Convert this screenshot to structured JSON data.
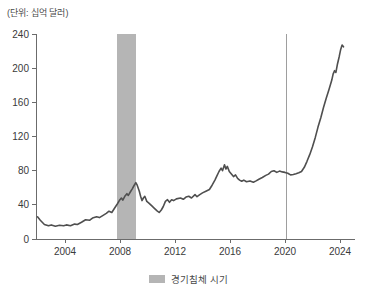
{
  "unit_label": "(단위: 십억 달러)",
  "legend": {
    "recession_label": "경기침체 시기",
    "swatch_style": "background:#b5b5b5"
  },
  "colors": {
    "line": "#4f4f4f",
    "band": "#b5b5b5",
    "vline": "#9e9e9e",
    "axis": "#6b6b6b",
    "tick_text": "#3a3a3a"
  },
  "chart_data": {
    "type": "line",
    "title": "",
    "unit": "(단위: 십억 달러)",
    "xlabel": "",
    "ylabel": "",
    "x_ticks": [
      2004,
      2008,
      2012,
      2016,
      2020,
      2024
    ],
    "y_ticks": [
      0,
      40,
      80,
      120,
      160,
      200,
      240
    ],
    "xlim": [
      2001.89,
      2025.09
    ],
    "ylim": [
      0,
      240
    ],
    "grid": false,
    "legend_position": "bottom",
    "recession_bands": [
      {
        "start": 2007.8,
        "end": 2009.15
      }
    ],
    "vlines": [
      2020.1
    ],
    "series": [
      {
        "name": "경기침체 시기 차트 값",
        "points": [
          [
            2002.0,
            26
          ],
          [
            2002.2,
            22
          ],
          [
            2002.5,
            17
          ],
          [
            2002.8,
            15.5
          ],
          [
            2003.0,
            16.5
          ],
          [
            2003.3,
            15
          ],
          [
            2003.6,
            16
          ],
          [
            2003.9,
            15.5
          ],
          [
            2004.1,
            16.5
          ],
          [
            2004.4,
            15.5
          ],
          [
            2004.7,
            17.5
          ],
          [
            2004.9,
            17
          ],
          [
            2005.2,
            19.5
          ],
          [
            2005.5,
            22.5
          ],
          [
            2005.8,
            22
          ],
          [
            2006.0,
            24.5
          ],
          [
            2006.3,
            26
          ],
          [
            2006.5,
            25
          ],
          [
            2006.8,
            28
          ],
          [
            2007.0,
            30
          ],
          [
            2007.2,
            32.5
          ],
          [
            2007.4,
            31
          ],
          [
            2007.6,
            36
          ],
          [
            2007.8,
            41
          ],
          [
            2007.95,
            45
          ],
          [
            2008.1,
            48
          ],
          [
            2008.2,
            45.5
          ],
          [
            2008.35,
            50
          ],
          [
            2008.5,
            53
          ],
          [
            2008.6,
            51
          ],
          [
            2008.75,
            55
          ],
          [
            2008.9,
            59
          ],
          [
            2009.0,
            62
          ],
          [
            2009.15,
            66
          ],
          [
            2009.25,
            63
          ],
          [
            2009.4,
            56
          ],
          [
            2009.5,
            50
          ],
          [
            2009.6,
            45
          ],
          [
            2009.7,
            48
          ],
          [
            2009.8,
            50
          ],
          [
            2009.95,
            44
          ],
          [
            2010.1,
            42
          ],
          [
            2010.3,
            39
          ],
          [
            2010.5,
            36
          ],
          [
            2010.7,
            33
          ],
          [
            2010.85,
            31
          ],
          [
            2011.0,
            34
          ],
          [
            2011.15,
            38
          ],
          [
            2011.3,
            44
          ],
          [
            2011.45,
            46
          ],
          [
            2011.6,
            43
          ],
          [
            2011.75,
            46
          ],
          [
            2011.9,
            45
          ],
          [
            2012.1,
            47
          ],
          [
            2012.4,
            48
          ],
          [
            2012.6,
            46.5
          ],
          [
            2012.8,
            49
          ],
          [
            2013.0,
            50
          ],
          [
            2013.2,
            48
          ],
          [
            2013.45,
            52
          ],
          [
            2013.6,
            49.5
          ],
          [
            2013.8,
            52
          ],
          [
            2014.0,
            54
          ],
          [
            2014.25,
            56
          ],
          [
            2014.5,
            58
          ],
          [
            2014.7,
            63
          ],
          [
            2014.9,
            69
          ],
          [
            2015.05,
            74
          ],
          [
            2015.2,
            79
          ],
          [
            2015.35,
            83
          ],
          [
            2015.45,
            80
          ],
          [
            2015.6,
            87
          ],
          [
            2015.7,
            82
          ],
          [
            2015.8,
            85
          ],
          [
            2015.95,
            79
          ],
          [
            2016.1,
            76
          ],
          [
            2016.25,
            73
          ],
          [
            2016.4,
            75
          ],
          [
            2016.55,
            71
          ],
          [
            2016.7,
            69
          ],
          [
            2016.85,
            67.5
          ],
          [
            2017.0,
            69
          ],
          [
            2017.2,
            67
          ],
          [
            2017.45,
            68
          ],
          [
            2017.7,
            66.5
          ],
          [
            2017.9,
            68
          ],
          [
            2018.1,
            70
          ],
          [
            2018.35,
            72
          ],
          [
            2018.6,
            74.5
          ],
          [
            2018.8,
            76
          ],
          [
            2019.0,
            79
          ],
          [
            2019.2,
            80
          ],
          [
            2019.4,
            78
          ],
          [
            2019.6,
            79.5
          ],
          [
            2019.8,
            78.5
          ],
          [
            2020.0,
            78
          ],
          [
            2020.2,
            77
          ],
          [
            2020.4,
            75
          ],
          [
            2020.6,
            75.5
          ],
          [
            2020.8,
            76.5
          ],
          [
            2021.0,
            77.5
          ],
          [
            2021.2,
            79
          ],
          [
            2021.4,
            84
          ],
          [
            2021.6,
            91
          ],
          [
            2021.8,
            99
          ],
          [
            2022.0,
            108
          ],
          [
            2022.2,
            119
          ],
          [
            2022.4,
            131
          ],
          [
            2022.6,
            142
          ],
          [
            2022.8,
            154
          ],
          [
            2023.0,
            165
          ],
          [
            2023.2,
            175
          ],
          [
            2023.4,
            186
          ],
          [
            2023.5,
            193
          ],
          [
            2023.6,
            197
          ],
          [
            2023.7,
            195
          ],
          [
            2023.8,
            204
          ],
          [
            2023.95,
            214
          ],
          [
            2024.05,
            222
          ],
          [
            2024.15,
            227
          ],
          [
            2024.25,
            225
          ]
        ]
      }
    ]
  }
}
